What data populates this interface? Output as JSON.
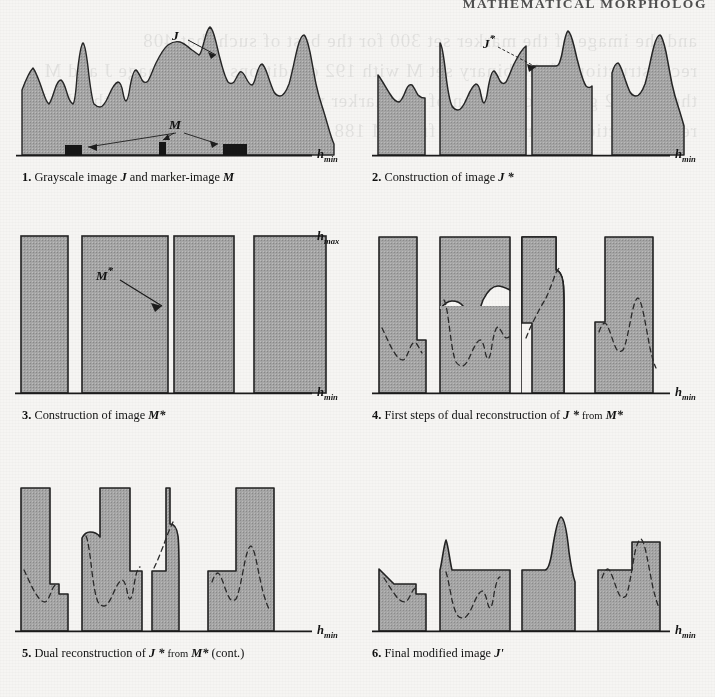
{
  "running_head": "MATHEMATICAL MORPHOLOG",
  "ghost_text": "and the image of the marker set 300 for the best of such that 408 reconstruction of the binary set M with 192 conditions in the image J and M the set 302 geodesic dilation of the marker within the mask 270 and the dual reconstruction by erosion of J from M 188 yields the final modified image",
  "colors": {
    "page_background": "#f6f5f3",
    "fill_gray": "#a5a5a5",
    "outline": "#1a1a1a",
    "marker_black": "#151515",
    "axis": "#1a1a1a"
  },
  "figure": {
    "type": "diagram",
    "panels": [
      {
        "id": 1,
        "number": "1.",
        "caption_parts": [
          "Grayscale image ",
          "J",
          " and marker-image ",
          "M"
        ],
        "caption_text": "1. Grayscale image J and marker-image M",
        "labels": [
          {
            "name": "curve-label-J",
            "text": "J",
            "x": 163,
            "y": 22
          },
          {
            "name": "marker-label-M",
            "text": "M",
            "x": 157,
            "y": 112
          }
        ],
        "axis_label": "h",
        "axis_sub": "min",
        "markers": [
          {
            "x": 53,
            "width": 17
          },
          {
            "x": 147,
            "width": 7
          },
          {
            "x": 211,
            "width": 24
          }
        ],
        "baseline_y": 155
      },
      {
        "id": 2,
        "number": "2.",
        "caption_parts": [
          "Construction of image ",
          "J *"
        ],
        "caption_text": "2. Construction of image J *",
        "labels": [
          {
            "name": "curve-label-J-star",
            "text": "J*",
            "x": 118,
            "y": 35
          }
        ],
        "axis_label": "h",
        "axis_sub": "min",
        "baseline_y": 155
      },
      {
        "id": 3,
        "number": "3.",
        "caption_parts": [
          "Construction of image ",
          "M*"
        ],
        "caption_text": "3. Construction of image M*",
        "labels": [
          {
            "name": "column-label-M-star",
            "text": "M*",
            "x": 85,
            "y": 48
          }
        ],
        "axis_label_top": "h",
        "axis_sub_top": "max",
        "axis_label": "h",
        "axis_sub": "min",
        "baseline_y": 392
      },
      {
        "id": 4,
        "number": "4.",
        "caption_parts": [
          "First steps of dual reconstruction of ",
          "J *",
          " from ",
          "M*"
        ],
        "caption_text": "4. First steps of dual reconstruction of J * from M*",
        "labels": [],
        "axis_label": "h",
        "axis_sub": "min",
        "baseline_y": 392
      },
      {
        "id": 5,
        "number": "5.",
        "caption_parts": [
          "Dual reconstruction of ",
          "J *",
          " from ",
          "M*",
          " (cont.)"
        ],
        "caption_text": "5. Dual reconstruction of J * from M* (cont.)",
        "labels": [],
        "axis_label": "h",
        "axis_sub": "min",
        "baseline_y": 630
      },
      {
        "id": 6,
        "number": "6.",
        "caption_parts": [
          "Final modified image ",
          "J'"
        ],
        "caption_text": "6. Final modified image J'",
        "labels": [],
        "axis_label": "h",
        "axis_sub": "min",
        "baseline_y": 630
      }
    ]
  }
}
